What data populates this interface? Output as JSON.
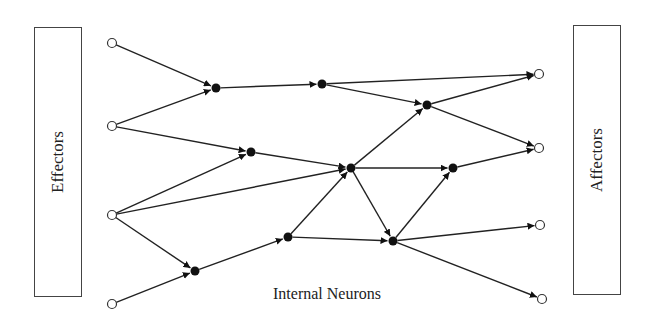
{
  "left_box": {
    "label": "Effectors",
    "x": 34,
    "y": 27,
    "w": 48,
    "h": 129
  },
  "right_box": {
    "label": "Affectors",
    "x": 573,
    "y": 25,
    "w": 48,
    "h": 129
  },
  "caption": {
    "text": "Internal Neurons",
    "x": 273,
    "y": 285
  },
  "colors": {
    "line": "#222222",
    "node_fill": "#111111",
    "open_node_fill": "#ffffff",
    "box_border": "#444444"
  },
  "nodes": [
    {
      "id": "I1",
      "type": "input",
      "x": 112,
      "y": 43
    },
    {
      "id": "I2",
      "type": "input",
      "x": 112,
      "y": 126
    },
    {
      "id": "I3",
      "type": "input",
      "x": 112,
      "y": 215
    },
    {
      "id": "I4",
      "type": "input",
      "x": 112,
      "y": 304
    },
    {
      "id": "N1",
      "type": "internal",
      "x": 216,
      "y": 88
    },
    {
      "id": "N2",
      "type": "internal",
      "x": 322,
      "y": 84
    },
    {
      "id": "N3",
      "type": "internal",
      "x": 427,
      "y": 105
    },
    {
      "id": "N4",
      "type": "internal",
      "x": 251,
      "y": 152
    },
    {
      "id": "N5",
      "type": "internal",
      "x": 351,
      "y": 168
    },
    {
      "id": "N6",
      "type": "internal",
      "x": 453,
      "y": 168
    },
    {
      "id": "N7",
      "type": "internal",
      "x": 288,
      "y": 237
    },
    {
      "id": "N8",
      "type": "internal",
      "x": 393,
      "y": 241
    },
    {
      "id": "N9",
      "type": "internal",
      "x": 195,
      "y": 271
    },
    {
      "id": "O1",
      "type": "output",
      "x": 539,
      "y": 74
    },
    {
      "id": "O2",
      "type": "output",
      "x": 539,
      "y": 148
    },
    {
      "id": "O3",
      "type": "output",
      "x": 540,
      "y": 225
    },
    {
      "id": "O4",
      "type": "output",
      "x": 542,
      "y": 299
    }
  ],
  "edges": [
    [
      "I1",
      "N1"
    ],
    [
      "I2",
      "N1"
    ],
    [
      "I2",
      "N4"
    ],
    [
      "I3",
      "N4"
    ],
    [
      "I3",
      "N5"
    ],
    [
      "I3",
      "N9"
    ],
    [
      "I4",
      "N9"
    ],
    [
      "N1",
      "N2"
    ],
    [
      "N2",
      "O1"
    ],
    [
      "N2",
      "N3"
    ],
    [
      "N3",
      "O1"
    ],
    [
      "N3",
      "O2"
    ],
    [
      "N4",
      "N5"
    ],
    [
      "N5",
      "N3"
    ],
    [
      "N5",
      "N6"
    ],
    [
      "N5",
      "N8"
    ],
    [
      "N6",
      "O2"
    ],
    [
      "N9",
      "N7"
    ],
    [
      "N7",
      "N5"
    ],
    [
      "N7",
      "N8"
    ],
    [
      "N8",
      "N6"
    ],
    [
      "N8",
      "O3"
    ],
    [
      "N8",
      "O4"
    ]
  ]
}
